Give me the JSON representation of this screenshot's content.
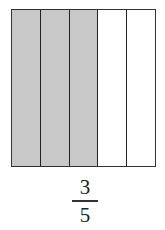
{
  "diagram": {
    "type": "fraction-model",
    "total_parts": 5,
    "shaded_parts": 3,
    "parts": [
      {
        "shaded": true
      },
      {
        "shaded": true
      },
      {
        "shaded": true
      },
      {
        "shaded": false
      },
      {
        "shaded": false
      }
    ],
    "colors": {
      "shaded": "#c8c8c8",
      "unshaded": "#ffffff",
      "border": "#333333"
    }
  },
  "fraction": {
    "numerator": "3",
    "denominator": "5"
  }
}
